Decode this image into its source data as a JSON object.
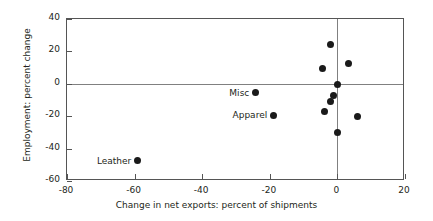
{
  "chart_data": {
    "type": "scatter",
    "title": "",
    "xlabel": "Change in net exports: percent of shipments",
    "ylabel": "Employment: percent change",
    "xlim": [
      -80,
      20
    ],
    "ylim": [
      -60,
      40
    ],
    "xticks": [
      -80,
      -60,
      -40,
      -20,
      0,
      20
    ],
    "yticks": [
      -60,
      -40,
      -20,
      0,
      20,
      40
    ],
    "xticklabels": [
      "-80",
      "-60",
      "-40",
      "-20",
      "0",
      "20"
    ],
    "yticklabels": [
      "-60",
      "-40",
      "-20",
      "0",
      "20",
      "40"
    ],
    "grid": false,
    "legend": "none",
    "zero_lines": true,
    "annotations": [
      {
        "label": "Misc",
        "x": -24.3,
        "y": -5.4
      },
      {
        "label": "Apparel",
        "x": -19.0,
        "y": -19.4
      },
      {
        "label": "Leather",
        "x": -59.2,
        "y": -47.5
      }
    ],
    "points": [
      {
        "x": -2.0,
        "y": 24.5,
        "label": ""
      },
      {
        "x": 3.3,
        "y": 12.3,
        "label": ""
      },
      {
        "x": -4.4,
        "y": 9.3,
        "label": ""
      },
      {
        "x": 0.0,
        "y": -0.6,
        "label": ""
      },
      {
        "x": -1.2,
        "y": -7.0,
        "label": ""
      },
      {
        "x": -2.0,
        "y": -11.0,
        "label": ""
      },
      {
        "x": -3.8,
        "y": -17.0,
        "label": ""
      },
      {
        "x": 5.9,
        "y": -20.0,
        "label": ""
      },
      {
        "x": 0.0,
        "y": -30.0,
        "label": ""
      },
      {
        "x": -24.3,
        "y": -5.4,
        "label": "Misc"
      },
      {
        "x": -19.0,
        "y": -19.4,
        "label": "Apparel"
      },
      {
        "x": -59.2,
        "y": -47.5,
        "label": "Leather"
      }
    ],
    "colors": {
      "marker": "#1a1a1a",
      "axis": "#555555",
      "zero_line": "#808080",
      "text": "#231f20",
      "background": "#ffffff"
    }
  }
}
